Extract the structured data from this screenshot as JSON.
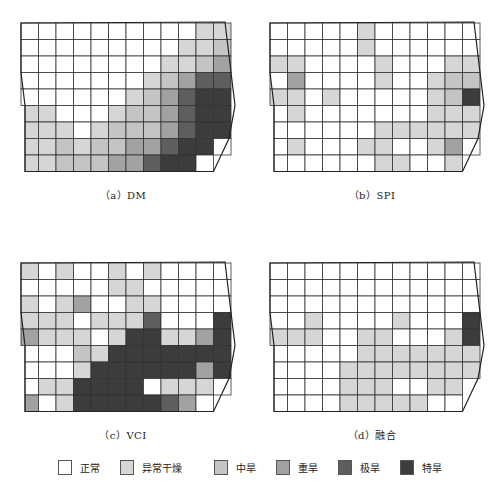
{
  "figure": {
    "legend": [
      {
        "label": "正常",
        "color": "#ffffff"
      },
      {
        "label": "异常干燥",
        "color": "#d6d6d6"
      },
      {
        "label": "中旱",
        "color": "#c4c4c4"
      },
      {
        "label": "重旱",
        "color": "#a2a2a2"
      },
      {
        "label": "极旱",
        "color": "#5e5e5e"
      },
      {
        "label": "特旱",
        "color": "#3c3c3c"
      }
    ],
    "panels": [
      {
        "id": "a",
        "caption": "（a）DM",
        "grid": [
          "000000000011",
          "000000000112",
          "000000001123",
          "000000012344",
          "000000123455",
          "110001223455",
          "111012223455",
          "112122334550",
          "112223345500"
        ]
      },
      {
        "id": "b",
        "caption": "（b）SPI",
        "grid": [
          "000001000000",
          "000001000000",
          "110000100011",
          "030000100122",
          "110100000125",
          "010000000111",
          "000000111111",
          "010001100130",
          "000000110010"
        ]
      },
      {
        "id": "c",
        "caption": "（c）VCI",
        "grid": [
          "101001010000",
          "000001100000",
          "101300110000",
          "111011140005",
          "311101551135",
          "000215555555",
          "000155555535",
          "011555501110",
          "301555554300"
        ]
      },
      {
        "id": "d",
        "caption": "（d）融合",
        "grid": [
          "000000000000",
          "000000000000",
          "000000000000",
          "001000010005",
          "111001100015",
          "000001111111",
          "000011111111",
          "000011100110",
          "000011111000"
        ]
      }
    ]
  }
}
